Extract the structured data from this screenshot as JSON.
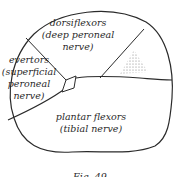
{
  "diagram": {
    "type": "cross-section of leg muscle compartments",
    "compartments": [
      {
        "id": "anterior",
        "line1": "dorsiflexors",
        "line2": "(deep peroneal",
        "line3": "nerve)"
      },
      {
        "id": "lateral",
        "line1": "evertors",
        "line2": "(superficial",
        "line3": "peroneal",
        "line4": "nerve)"
      },
      {
        "id": "posterior",
        "line1": "plantar flexors",
        "line2": "(tibial nerve)"
      }
    ],
    "bones": [
      {
        "id": "tibia",
        "style": "stippled triangle"
      },
      {
        "id": "fibula",
        "style": "small outlined shape"
      }
    ],
    "caption": "Fig. 49"
  },
  "colors": {
    "ink": "#2a2a2a",
    "stipple": "#666666",
    "background": "#ffffff"
  }
}
